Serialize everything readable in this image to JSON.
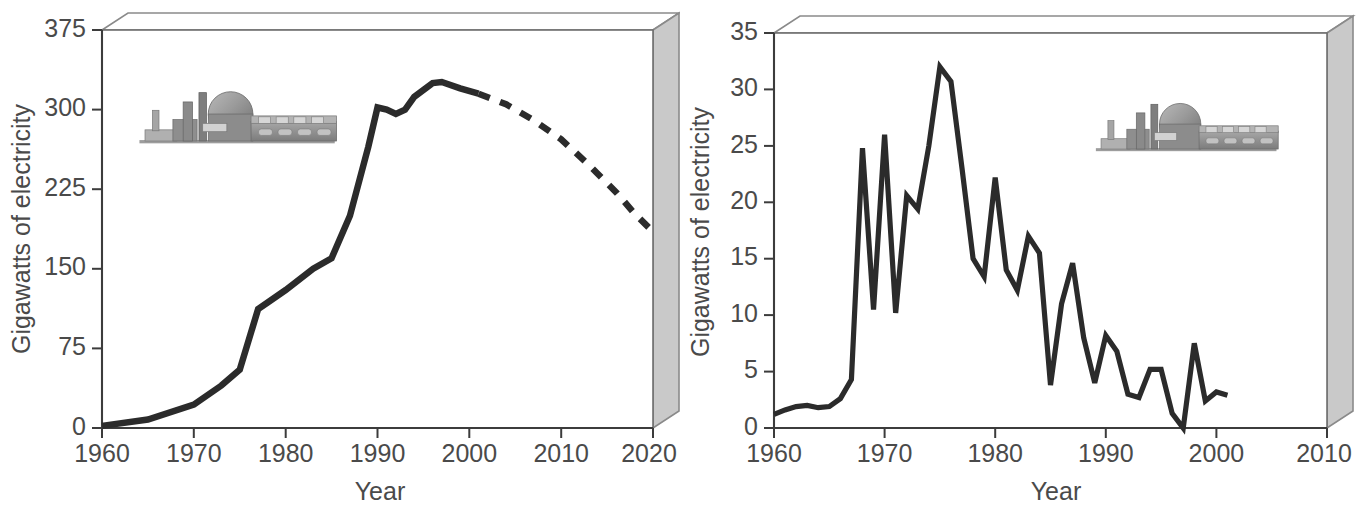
{
  "figure": {
    "name": "nuclear-capacity-two-panel-figure",
    "panels": [
      "left",
      "right"
    ]
  },
  "icon": {
    "name": "nuclear-power-plant-icon",
    "description": "grayscale nuclear power plant with containment dome, chimney stack and turbine hall"
  },
  "colors": {
    "line": "#2b2b2b",
    "axis": "#3c3c3c",
    "text": "#4a4a4a",
    "box_side": "#c9c9c9",
    "box_outline": "#8a8a8a",
    "background": "#ffffff"
  },
  "chart_data": [
    {
      "id": "left",
      "type": "line",
      "title": "",
      "xlabel": "Year",
      "ylabel": "Gigawatts of electricity",
      "xlim": [
        1960,
        2020
      ],
      "ylim": [
        0,
        375
      ],
      "xticks": [
        1960,
        1970,
        1980,
        1990,
        2000,
        2010,
        2020
      ],
      "xticklabels": [
        "1960",
        "1970",
        "1980",
        "1990",
        "2000",
        "2010",
        "2020"
      ],
      "yticks": [
        0,
        75,
        150,
        225,
        300,
        375
      ],
      "yticklabels": [
        "0",
        "75",
        "150",
        "225",
        "300",
        "375"
      ],
      "grid": false,
      "legend": "none",
      "series": [
        {
          "name": "Installed nuclear capacity (historical)",
          "style": "solid",
          "x": [
            1960,
            1965,
            1970,
            1973,
            1975,
            1977,
            1978,
            1980,
            1983,
            1985,
            1987,
            1989,
            1990,
            1991,
            1992,
            1993,
            1994,
            1996,
            1997,
            1999,
            2001
          ],
          "y": [
            2,
            8,
            22,
            40,
            55,
            112,
            118,
            130,
            150,
            160,
            200,
            265,
            302,
            300,
            296,
            300,
            312,
            325,
            326,
            320,
            315
          ]
        },
        {
          "name": "Projected nuclear capacity",
          "style": "dashed",
          "x": [
            2001,
            2004,
            2007,
            2010,
            2013,
            2016,
            2018,
            2020
          ],
          "y": [
            315,
            305,
            290,
            272,
            248,
            222,
            202,
            185
          ]
        }
      ]
    },
    {
      "id": "right",
      "type": "line",
      "title": "",
      "xlabel": "Year",
      "ylabel": "Gigawatts of electricity",
      "xlim": [
        1960,
        2010
      ],
      "ylim": [
        0,
        35
      ],
      "xticks": [
        1960,
        1970,
        1980,
        1990,
        2000,
        2010
      ],
      "xticklabels": [
        "1960",
        "1970",
        "1980",
        "1990",
        "2000",
        "2010"
      ],
      "yticks": [
        0,
        5,
        10,
        15,
        20,
        25,
        30,
        35
      ],
      "yticklabels": [
        "0",
        "5",
        "10",
        "15",
        "20",
        "25",
        "30",
        "35"
      ],
      "grid": false,
      "legend": "none",
      "series": [
        {
          "name": "Annual nuclear capacity added",
          "style": "solid",
          "x": [
            1960,
            1961,
            1962,
            1963,
            1964,
            1965,
            1966,
            1967,
            1968,
            1969,
            1970,
            1971,
            1972,
            1973,
            1974,
            1975,
            1976,
            1977,
            1978,
            1979,
            1980,
            1981,
            1982,
            1983,
            1984,
            1985,
            1986,
            1987,
            1988,
            1989,
            1990,
            1991,
            1992,
            1993,
            1994,
            1995,
            1996,
            1997,
            1998,
            1999,
            2000,
            2001
          ],
          "y": [
            1.2,
            1.6,
            1.9,
            2.0,
            1.8,
            1.9,
            2.6,
            4.3,
            24.8,
            10.5,
            26.0,
            10.2,
            20.6,
            19.4,
            25.0,
            32.0,
            30.7,
            23.0,
            15.0,
            13.4,
            22.2,
            14.0,
            12.2,
            17.0,
            15.5,
            3.8,
            11.0,
            14.6,
            8.0,
            4.0,
            8.2,
            6.8,
            3.0,
            2.7,
            5.2,
            5.2,
            1.3,
            0.0,
            7.5,
            2.4,
            3.2,
            2.9
          ]
        }
      ]
    }
  ]
}
